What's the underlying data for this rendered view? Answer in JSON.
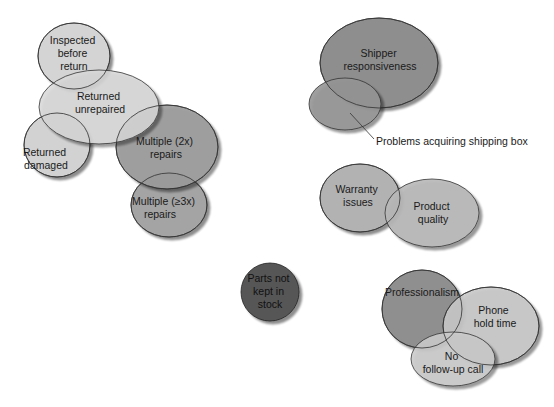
{
  "diagram": {
    "type": "affinity-bubble-diagram",
    "clusters": [
      {
        "name": "returns-repairs",
        "bubbles": [
          {
            "id": "inspected",
            "lines": [
              "Inspected",
              "before",
              "return"
            ],
            "cx": 74,
            "cy": 56,
            "rx": 36,
            "ry": 33,
            "fill": "#d4d4d4"
          },
          {
            "id": "unrepaired",
            "lines": [
              "Returned",
              "unrepaired"
            ],
            "cx": 99,
            "cy": 107,
            "rx": 60,
            "ry": 37,
            "fill": "#d8d8d8"
          },
          {
            "id": "damaged",
            "lines": [
              "Returned",
              "damaged"
            ],
            "cx": 57,
            "cy": 145,
            "rx": 33,
            "ry": 32,
            "fill": "#d2d2d2"
          },
          {
            "id": "multiple2",
            "lines": [
              "Multiple (2x)",
              "repairs"
            ],
            "cx": 167,
            "cy": 147,
            "rx": 51,
            "ry": 42,
            "fill": "#9c9c9c"
          },
          {
            "id": "multiple3",
            "lines": [
              "Multiple (≥3x)",
              "repairs"
            ],
            "cx": 169,
            "cy": 205,
            "rx": 38,
            "ry": 32,
            "fill": "#a4a4a4"
          }
        ]
      },
      {
        "name": "shipping",
        "bubbles": [
          {
            "id": "shipper",
            "lines": [
              "Shipper",
              "responsiveness"
            ],
            "cx": 379,
            "cy": 63,
            "rx": 59,
            "ry": 45,
            "fill": "#8e8e8e"
          },
          {
            "id": "shipping-box",
            "lines": [],
            "cx": 345,
            "cy": 104,
            "rx": 36,
            "ry": 26,
            "fill": "#959595"
          }
        ],
        "callout": {
          "text": "Problems acquiring shipping box",
          "x1": 350,
          "y1": 113,
          "x2": 374,
          "y2": 139,
          "tx": 375,
          "ty": 145
        }
      },
      {
        "name": "product",
        "bubbles": [
          {
            "id": "warranty",
            "lines": [
              "Warranty",
              "issues"
            ],
            "cx": 360,
            "cy": 198,
            "rx": 40,
            "ry": 34,
            "fill": "#b2b2b2"
          },
          {
            "id": "quality",
            "lines": [
              "Product",
              "quality"
            ],
            "cx": 432,
            "cy": 213,
            "rx": 47,
            "ry": 34,
            "fill": "#b8b8b8"
          }
        ]
      },
      {
        "name": "parts",
        "bubbles": [
          {
            "id": "parts",
            "lines": [
              "Parts not",
              "kept in",
              "stock"
            ],
            "cx": 270,
            "cy": 292,
            "rx": 29,
            "ry": 29,
            "fill": "#575757"
          }
        ]
      },
      {
        "name": "service",
        "bubbles": [
          {
            "id": "professionalism",
            "lines": [
              "Professionalism"
            ],
            "cx": 422,
            "cy": 309,
            "rx": 40,
            "ry": 39,
            "fill": "#8f8f8f"
          },
          {
            "id": "phone",
            "lines": [
              "Phone",
              "hold time"
            ],
            "cx": 491,
            "cy": 326,
            "rx": 48,
            "ry": 39,
            "fill": "#c6c6c6"
          },
          {
            "id": "followup",
            "lines": [
              "No",
              "follow-up call"
            ],
            "cx": 453,
            "cy": 359,
            "rx": 42,
            "ry": 27,
            "fill": "#cbcbcb"
          }
        ]
      }
    ]
  },
  "labels": {
    "inspected": [
      "Inspected",
      "before",
      "return"
    ],
    "unrepaired": [
      "Returned",
      "unrepaired"
    ],
    "damaged": [
      "Returned",
      "damaged"
    ],
    "multiple2": [
      "Multiple (2x)",
      "repairs"
    ],
    "multiple3": [
      "Multiple (≥3x)",
      "repairs"
    ],
    "shipper": [
      "Shipper",
      "responsiveness"
    ],
    "callout": "Problems acquiring shipping box",
    "warranty": [
      "Warranty",
      "issues"
    ],
    "quality": [
      "Product",
      "quality"
    ],
    "parts": [
      "Parts not",
      "kept in",
      "stock"
    ],
    "professionalism": "Professionalism",
    "phone": [
      "Phone",
      "hold time"
    ],
    "followup": [
      "No",
      "follow-up call"
    ]
  }
}
